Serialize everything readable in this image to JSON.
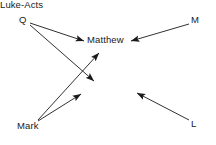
{
  "diagram": {
    "background_color": "#ffffff",
    "line_color": "#1a1a1a",
    "text_color": "#1a1a1a",
    "nodes": [
      {
        "id": "q",
        "label": "Q",
        "x": 24,
        "y": 20
      },
      {
        "id": "m",
        "label": "M",
        "x": 196,
        "y": 20
      },
      {
        "id": "matthew",
        "label": "Matthew",
        "x": 106,
        "y": 41
      },
      {
        "id": "luke",
        "label": "Luke-Acts",
        "x": 107,
        "y": 93
      },
      {
        "id": "mark",
        "label": "Mark",
        "x": 30,
        "y": 127
      },
      {
        "id": "l",
        "label": "L",
        "x": 195,
        "y": 124
      }
    ],
    "edges": [
      {
        "id": "q-matthew",
        "from": "Q",
        "to": "Matthew",
        "x1": 30,
        "y1": 23,
        "x2": 85,
        "y2": 41
      },
      {
        "id": "q-luke",
        "from": "Q",
        "to": "Luke-Acts",
        "x1": 30,
        "y1": 24,
        "x2": 95,
        "y2": 82
      },
      {
        "id": "mark-matthew",
        "from": "Mark",
        "to": "Matthew",
        "x1": 38,
        "y1": 120,
        "x2": 98,
        "y2": 53
      },
      {
        "id": "mark-luke",
        "from": "Mark",
        "to": "Luke-Acts",
        "x1": 38,
        "y1": 121,
        "x2": 82,
        "y2": 93
      },
      {
        "id": "m-matthew",
        "from": "M",
        "to": "Matthew",
        "x1": 188,
        "y1": 24,
        "x2": 130,
        "y2": 41
      },
      {
        "id": "l-luke",
        "from": "L",
        "to": "Luke-Acts",
        "x1": 188,
        "y1": 120,
        "x2": 136,
        "y2": 93
      }
    ]
  }
}
